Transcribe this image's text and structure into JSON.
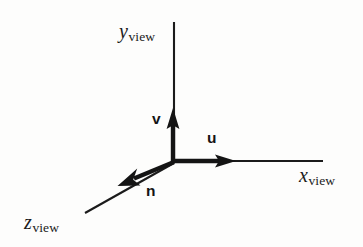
{
  "figure": {
    "kind": "3d-axes-diagram",
    "background_color": "#fdfdfc",
    "ink_color": "#1b1b1b",
    "width": 363,
    "height": 247,
    "origin": {
      "x": 173,
      "y": 162
    }
  },
  "axes": [
    {
      "id": "y-view",
      "base": "y",
      "subscript": "view",
      "direction": "up",
      "line": {
        "x1": 174,
        "y1": 22,
        "x2": 174,
        "y2": 162
      },
      "stroke_width": 2.1
    },
    {
      "id": "x-view",
      "base": "x",
      "subscript": "view",
      "direction": "right",
      "line": {
        "x1": 173,
        "y1": 161,
        "x2": 323,
        "y2": 161
      },
      "stroke_width": 2.1
    },
    {
      "id": "z-view",
      "base": "z",
      "subscript": "view",
      "direction": "down-left",
      "line": {
        "x1": 173,
        "y1": 162,
        "x2": 85,
        "y2": 212
      },
      "stroke_width": 2.1
    }
  ],
  "vectors": [
    {
      "id": "v",
      "label": "v",
      "description": "view-up unit vector along y-view",
      "line": {
        "x1": 173,
        "y1": 162,
        "x2": 173,
        "y2": 118
      },
      "tip": {
        "x": 173,
        "y": 110
      },
      "stroke_width": 4.2,
      "arrowhead": "solid"
    },
    {
      "id": "u",
      "label": "u",
      "description": "unit vector along x-view",
      "line": {
        "x1": 173,
        "y1": 161,
        "x2": 224,
        "y2": 161
      },
      "tip": {
        "x": 234,
        "y": 161
      },
      "stroke_width": 4.2,
      "arrowhead": "solid"
    },
    {
      "id": "n",
      "label": "n",
      "description": "view-plane normal unit vector along z-view",
      "line": {
        "x1": 173,
        "y1": 162,
        "x2": 130,
        "y2": 180
      },
      "tip": {
        "x": 120,
        "y": 185
      },
      "stroke_width": 4.2,
      "arrowhead": "solid"
    }
  ]
}
